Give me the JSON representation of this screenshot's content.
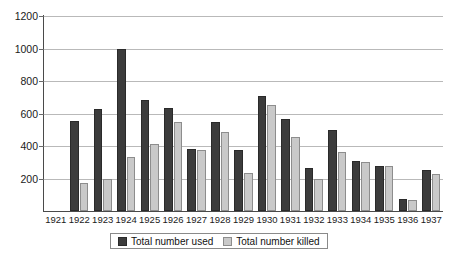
{
  "chart_data": {
    "type": "bar",
    "title": "",
    "subtitle": "",
    "xlabel": "",
    "ylabel": "",
    "ylim": [
      0,
      1200
    ],
    "ytick_step": 200,
    "yticks": [
      0,
      200,
      400,
      600,
      800,
      1000,
      1200
    ],
    "ytick_labels": [
      "",
      "200",
      "400",
      "600",
      "800",
      "1000",
      "1200"
    ],
    "grid": true,
    "legend_position": "bottom-center",
    "categories": [
      "1921",
      "1922",
      "1923",
      "1924",
      "1925",
      "1926",
      "1927",
      "1928",
      "1929",
      "1930",
      "1931",
      "1932",
      "1933",
      "1934",
      "1935",
      "1936",
      "1937"
    ],
    "series": [
      {
        "name": "Total number used",
        "color": "#3c3c3c",
        "values": [
          0,
          555,
          630,
          1000,
          685,
          635,
          380,
          545,
          375,
          705,
          565,
          265,
          500,
          310,
          275,
          75,
          250
        ]
      },
      {
        "name": "Total number killed",
        "color": "#c9c9c9",
        "values": [
          0,
          170,
          195,
          330,
          410,
          545,
          375,
          485,
          235,
          655,
          455,
          195,
          365,
          300,
          275,
          65,
          225
        ]
      }
    ]
  },
  "legend": {
    "entries": [
      {
        "label": "Total number used",
        "swatch": "used"
      },
      {
        "label": "Total number killed",
        "swatch": "killed"
      }
    ]
  },
  "colors": {
    "used": "#3c3c3c",
    "killed": "#c9c9c9",
    "gridline": "#b9b9b9",
    "axis": "#4a4a4a",
    "text": "#1a1a1a",
    "background": "#ffffff"
  }
}
